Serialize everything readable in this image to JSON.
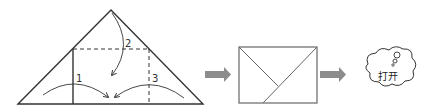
{
  "diagram": {
    "step_labels": [
      "1",
      "2",
      "3"
    ],
    "cloud_text": "打开",
    "colors": {
      "line": "#333333",
      "arrow": "#8c8c8c",
      "envelope": "#666666"
    },
    "icons": [
      "folded-triangle",
      "fold-arrow",
      "block-arrow",
      "envelope",
      "thought-cloud"
    ]
  }
}
